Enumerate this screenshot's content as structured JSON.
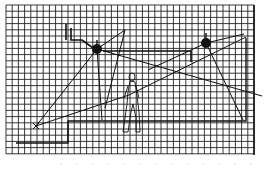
{
  "figure": {
    "grid": {
      "x0": 6,
      "y0": 5,
      "x1": 254,
      "y1": 154,
      "step": 6.2,
      "color": "#1a1a1a"
    },
    "colors": {
      "ink": "#111111",
      "paper": "#ffffff",
      "grid": "#222222"
    },
    "lamps": [
      {
        "name": "left-lamp",
        "x": 97,
        "y": 49
      },
      {
        "name": "right-lamp",
        "x": 206,
        "y": 43
      }
    ],
    "marker": {
      "name": "ray-origin-x",
      "x": 36,
      "y": 126
    },
    "caption": "· · · · · · · · · · · · ·"
  }
}
